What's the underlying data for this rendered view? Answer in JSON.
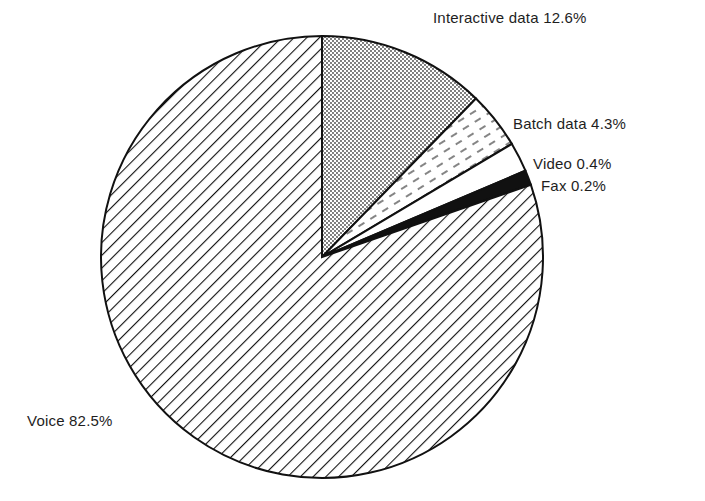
{
  "chart_data": {
    "type": "pie",
    "title": "",
    "start_angle_deg": 0,
    "direction": "clockwise",
    "slices": [
      {
        "label": "Interactive data",
        "value": 12.6,
        "display": "Interactive data 12.6%",
        "fill": "dots"
      },
      {
        "label": "Batch data",
        "value": 4.3,
        "display": "Batch data 4.3%",
        "fill": "dashes"
      },
      {
        "label": "Video",
        "value": 0.4,
        "display": "Video 0.4%",
        "fill": "white"
      },
      {
        "label": "Fax",
        "value": 0.2,
        "display": "Fax 0.2%",
        "fill": "black"
      },
      {
        "label": "Voice",
        "value": 82.5,
        "display": "Voice 82.5%",
        "fill": "diagonal-hatch"
      }
    ],
    "categories": [
      "Interactive data",
      "Batch data",
      "Video",
      "Fax",
      "Voice"
    ],
    "values": [
      12.6,
      4.3,
      0.4,
      0.2,
      82.5
    ],
    "unit": "%"
  },
  "labels": {
    "interactive": "Interactive data 12.6%",
    "batch": "Batch data 4.3%",
    "video": "Video 0.4%",
    "fax": "Fax 0.2%",
    "voice": "Voice 82.5%"
  }
}
